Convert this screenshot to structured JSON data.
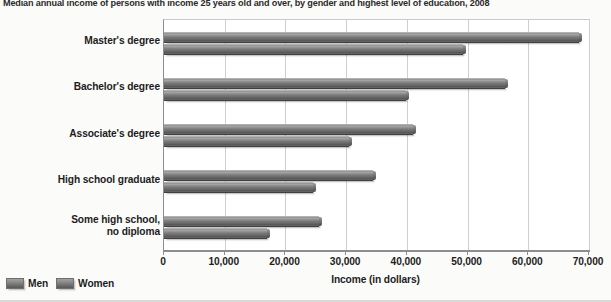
{
  "chart_data": {
    "type": "bar",
    "orientation": "horizontal",
    "title": "Median annual income of persons with income 25 years old and over, by gender and highest level of education, 2008",
    "xlabel": "Income (in dollars)",
    "ylabel": "",
    "xlim": [
      0,
      70000
    ],
    "xticks": [
      0,
      10000,
      20000,
      30000,
      40000,
      50000,
      60000,
      70000
    ],
    "xtick_labels": [
      "0",
      "10,000",
      "20,000",
      "30,000",
      "40,000",
      "50,000",
      "60,000",
      "70,000"
    ],
    "grid": true,
    "grid_axis": "x",
    "legend_position": "bottom-left",
    "categories": [
      "Master's degree",
      "Bachelor's degree",
      "Associate's degree",
      "High school graduate",
      "Some high school,\nno diploma"
    ],
    "series": [
      {
        "name": "Men",
        "color": "#6b6b6b",
        "values": [
          68300,
          56200,
          41000,
          34400,
          25500
        ]
      },
      {
        "name": "Women",
        "color": "#6b6b6b",
        "values": [
          49300,
          39900,
          30500,
          24600,
          17000
        ]
      }
    ]
  },
  "legend": {
    "items": [
      {
        "label": "Men"
      },
      {
        "label": "Women"
      }
    ]
  }
}
